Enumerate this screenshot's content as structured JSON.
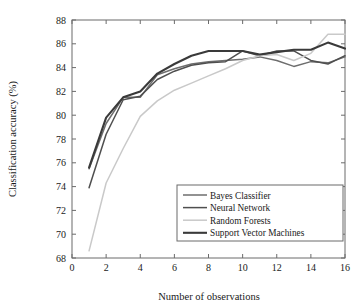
{
  "chart_data": {
    "type": "line",
    "title": "",
    "xlabel": "Number of observations",
    "ylabel": "Classification accuracy (%)",
    "xlim": [
      0,
      16
    ],
    "ylim": [
      68,
      88
    ],
    "xticks": [
      0,
      2,
      4,
      6,
      8,
      10,
      12,
      14,
      16
    ],
    "yticks": [
      68,
      70,
      72,
      74,
      76,
      78,
      80,
      82,
      84,
      86,
      88
    ],
    "grid": false,
    "legend_position": "lower right",
    "x": [
      1,
      2,
      3,
      4,
      5,
      6,
      7,
      8,
      9,
      10,
      11,
      12,
      13,
      14,
      15,
      16
    ],
    "series": [
      {
        "name": "Bayes Classifier",
        "color": "#6e6e6e",
        "width": 1.5,
        "values": [
          75.5,
          79.3,
          81.5,
          81.5,
          83.4,
          83.9,
          84.3,
          84.5,
          84.6,
          84.7,
          84.9,
          84.6,
          84.1,
          84.5,
          84.4,
          84.9
        ]
      },
      {
        "name": "Neural Network",
        "color": "#4f4f4f",
        "width": 1.5,
        "values": [
          73.9,
          78.4,
          81.3,
          81.6,
          83.0,
          83.7,
          84.2,
          84.4,
          84.5,
          85.4,
          85.0,
          85.4,
          85.4,
          84.6,
          84.3,
          85.0
        ]
      },
      {
        "name": "Random Forests",
        "color": "#c9c9c9",
        "width": 1.5,
        "values": [
          68.6,
          74.3,
          77.2,
          79.9,
          81.2,
          82.1,
          82.7,
          83.3,
          83.9,
          84.6,
          85.0,
          85.1,
          84.6,
          85.2,
          86.8,
          86.8
        ]
      },
      {
        "name": "Support Vector Machines",
        "color": "#3a3a3a",
        "width": 2.1,
        "values": [
          75.6,
          79.8,
          81.5,
          82.0,
          83.5,
          84.3,
          85.0,
          85.4,
          85.4,
          85.4,
          85.1,
          85.3,
          85.5,
          85.5,
          86.1,
          85.6
        ]
      }
    ]
  },
  "legend": {
    "entries": [
      {
        "label": "Bayes Classifier"
      },
      {
        "label": "Neural Network"
      },
      {
        "label": "Random Forests"
      },
      {
        "label": "Support Vector Machines"
      }
    ]
  },
  "axes": {
    "x_title": "Number of observations",
    "y_title": "Classification accuracy (%)",
    "x_tick_labels": [
      "0",
      "2",
      "4",
      "6",
      "8",
      "10",
      "12",
      "14",
      "16"
    ],
    "y_tick_labels": [
      "68",
      "70",
      "72",
      "74",
      "76",
      "78",
      "80",
      "82",
      "84",
      "86",
      "88"
    ]
  },
  "colors": {
    "frame": "#6b6b6b",
    "text": "#1a1a1a",
    "background": "#ffffff"
  }
}
